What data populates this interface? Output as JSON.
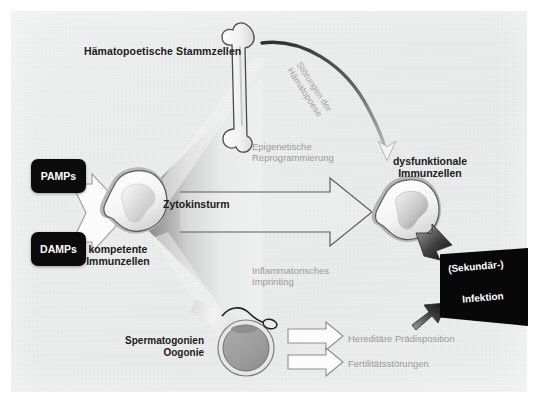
{
  "figure": {
    "panel_bg": "#e8e9e9",
    "accent_dark": "#0b0b0b",
    "accent_gray": "#9a9a9a"
  },
  "labels": {
    "hematopoietic_stem_cells": "Hämatopoetische Stammzellen",
    "cytokine_storm": "Zytokinsturm",
    "competent_immune_cells": "kompetente\nImmunzellen",
    "dysfunctional_immune_cells": "dysfunktionale\nImmunzellen",
    "spermatogonia_oogonia": "Spermatogonien\nOogonie",
    "epigenetic_reprogramming": "Epigenetische\nReprogrammierung",
    "inflammatory_imprinting": "Inflammatorisches\nImprinting",
    "hematopoiesis_disorder": "Störungen der\nHämatopoese",
    "hereditary_predisposition": "Hereditäre Prädisposition",
    "fertility_disorders": "Fertilitätsstörungen"
  },
  "chips": {
    "pamps": "PAMPs",
    "damps": "DAMPs"
  },
  "infection_box": {
    "line1": "(Sekundär-)",
    "line2": "Infektion"
  },
  "icons": {
    "bone": "bone-icon",
    "competent_cell": "immune-cell-icon",
    "dysfunctional_cell": "dysfunctional-immune-cell-icon",
    "oocyte": "oocyte-icon",
    "sperm": "sperm-cell-icon",
    "merge_arrow": "merge-arrow-icon",
    "big_arrow": "large-right-arrow-icon",
    "curved_arrow": "curved-feedback-arrow-icon",
    "infection_arrow_top": "infection-arrow-top-icon",
    "infection_arrow_bottom": "infection-arrow-bottom-icon",
    "hereditary_arrow": "hereditary-arrow-icon",
    "fertility_arrow": "fertility-arrow-icon"
  }
}
